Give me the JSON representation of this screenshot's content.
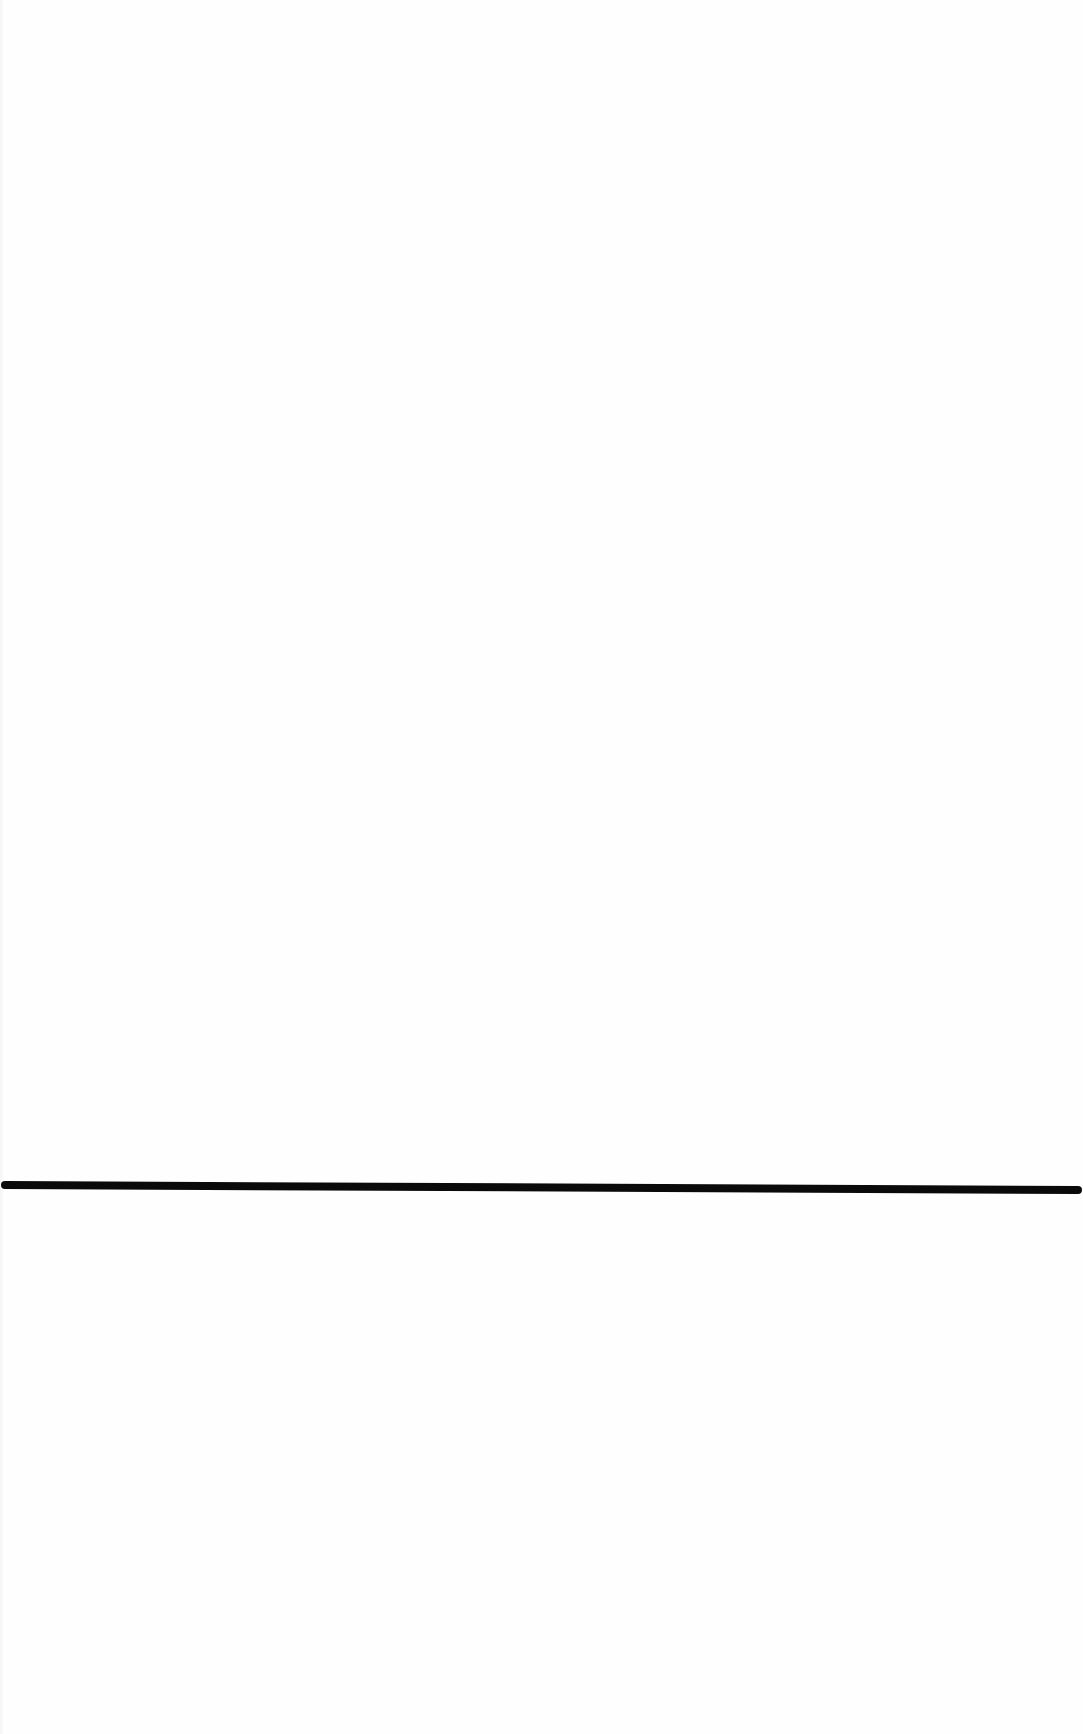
{
  "page": {
    "background_color": "#fefefe",
    "text_content": []
  },
  "horizontal_rule": {
    "color": "#0a0a0a",
    "thickness_px": 8,
    "x_start": 5,
    "x_end": 1078,
    "y_left": 1185,
    "y_right": 1190
  }
}
